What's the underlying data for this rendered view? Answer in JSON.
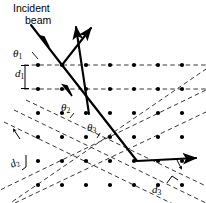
{
  "figure": {
    "type": "crystal-diffraction-diagram",
    "background_color": "#ffffff",
    "stroke_color": "#000000",
    "dashed_color": "#2b2b2b"
  },
  "labels": {
    "incident_line1": "Incident",
    "incident_line2": "beam",
    "theta1": "θ",
    "theta1_sub": "1",
    "theta2": "θ",
    "theta2_sub": "2",
    "theta3": "θ",
    "theta3_sub": "3",
    "d1": "d",
    "d1_sub": "1",
    "d2": "d",
    "d2_sub": "2",
    "d3": "d",
    "d3_sub": "3"
  },
  "lattice": {
    "dot_radius": 2.1,
    "dot_color": "#000000",
    "column_spacing": 24,
    "row_spacing": 24,
    "first_column_x": 38,
    "first_row_y": 65,
    "columns": 7,
    "rows": 6,
    "row_y_values": [
      65,
      89,
      113,
      137,
      161,
      185
    ],
    "column_x_values": [
      38,
      62,
      86,
      110,
      134,
      158,
      182
    ]
  },
  "plane_sets": [
    {
      "name": "horizontal-planes-d1",
      "spacing_label": "d1",
      "angle_deg": 0,
      "count": 2
    },
    {
      "name": "tilted-planes-d2",
      "spacing_label": "d2",
      "angle_deg": -26,
      "count": 3
    },
    {
      "name": "tilted-planes-d3",
      "spacing_label": "d3",
      "angle_deg": 26,
      "count": 3
    }
  ],
  "beams": {
    "incident": {
      "from": [
        33,
        27
      ],
      "to": [
        62,
        65
      ],
      "has_arrowhead_midway": true
    },
    "reflected_1": {
      "from": [
        62,
        65
      ],
      "to": [
        92,
        26
      ],
      "arrow": "up-right"
    },
    "reflected_2": {
      "from": [
        88,
        113
      ],
      "to": [
        76,
        24
      ],
      "arrow": "up-left"
    },
    "transmitted": {
      "path": [
        [
          62,
          65
        ],
        [
          88,
          113
        ],
        [
          137,
          161
        ],
        [
          201,
          158
        ]
      ],
      "arrow": "right"
    }
  }
}
